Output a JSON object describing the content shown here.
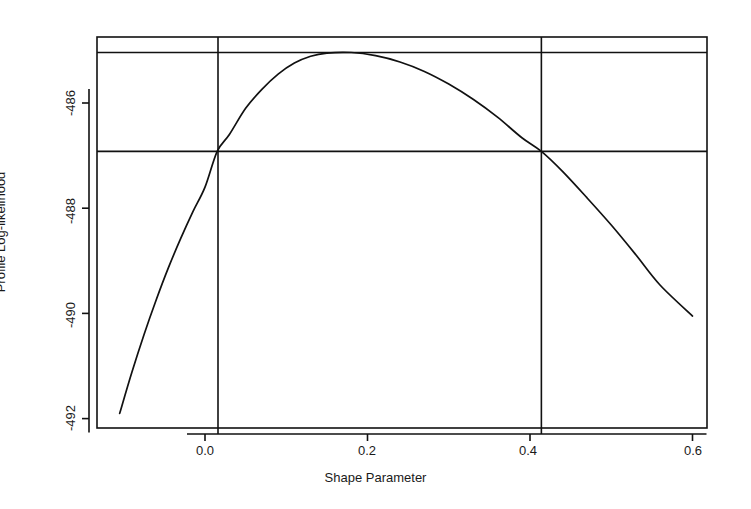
{
  "chart_data": {
    "type": "line",
    "title": "",
    "xlabel": "Shape Parameter",
    "ylabel": "Profile Log-likelihood",
    "xlim": [
      -0.125,
      0.625
    ],
    "ylim": [
      -492.4,
      -484.7
    ],
    "grid": false,
    "legend": false,
    "xticks": [
      0.0,
      0.2,
      0.4,
      0.6
    ],
    "xticklabels": [
      "0.0",
      "0.2",
      "0.4",
      "0.6"
    ],
    "yticks": [
      -486,
      -488,
      -490,
      -492
    ],
    "yticklabels": [
      "-486",
      "-488",
      "-490",
      "-492"
    ],
    "series": [
      {
        "name": "profile log-likelihood",
        "x": [
          -0.105,
          -0.09,
          -0.075,
          -0.06,
          -0.045,
          -0.03,
          -0.015,
          0.0,
          0.015,
          0.03,
          0.05,
          0.07,
          0.09,
          0.11,
          0.13,
          0.15,
          0.18,
          0.21,
          0.24,
          0.27,
          0.3,
          0.33,
          0.36,
          0.39,
          0.414,
          0.44,
          0.47,
          0.5,
          0.53,
          0.56,
          0.6
        ],
        "y": [
          -491.9,
          -491.12,
          -490.4,
          -489.74,
          -489.13,
          -488.58,
          -488.07,
          -487.6,
          -486.92,
          -486.6,
          -486.1,
          -485.74,
          -485.45,
          -485.24,
          -485.11,
          -485.05,
          -485.04,
          -485.1,
          -485.22,
          -485.4,
          -485.64,
          -485.93,
          -486.27,
          -486.66,
          -486.92,
          -487.3,
          -487.8,
          -488.32,
          -488.88,
          -489.46,
          -490.05
        ]
      }
    ],
    "reference_lines": {
      "horizontal": [
        {
          "name": "maximum-log-likelihood",
          "value": -485.04
        },
        {
          "name": "confidence-interval-cutoff",
          "value": -486.92
        }
      ],
      "vertical": [
        {
          "name": "ci-lower-bound",
          "value": 0.016
        },
        {
          "name": "ci-upper-bound",
          "value": 0.414
        }
      ]
    },
    "annotations": {
      "mle_estimate": 0.18,
      "ci_lower": 0.016,
      "ci_upper": 0.414,
      "max_loglik": -485.04
    },
    "colors": {
      "curve": "#111111",
      "axis": "#111111",
      "reference": "#111111",
      "background": "#ffffff"
    }
  }
}
